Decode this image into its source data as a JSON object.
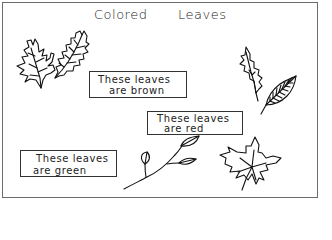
{
  "worksheet": {
    "title_words": [
      "Colored",
      "Leaves"
    ],
    "labels": {
      "brown": {
        "line1": "These leaves",
        "line2": "are brown"
      },
      "red": {
        "line1": "These leaves",
        "line2": "are red"
      },
      "green": {
        "line1": "These leaves",
        "line2": "are green"
      }
    },
    "illustrations": [
      "oak-leaf-pair",
      "holly-leaf",
      "veined-elm-leaf",
      "leafy-twig",
      "maple-leaf"
    ],
    "colors": {
      "ink": "#111111",
      "frame": "#6b6b6b",
      "background": "#ffffff"
    }
  }
}
